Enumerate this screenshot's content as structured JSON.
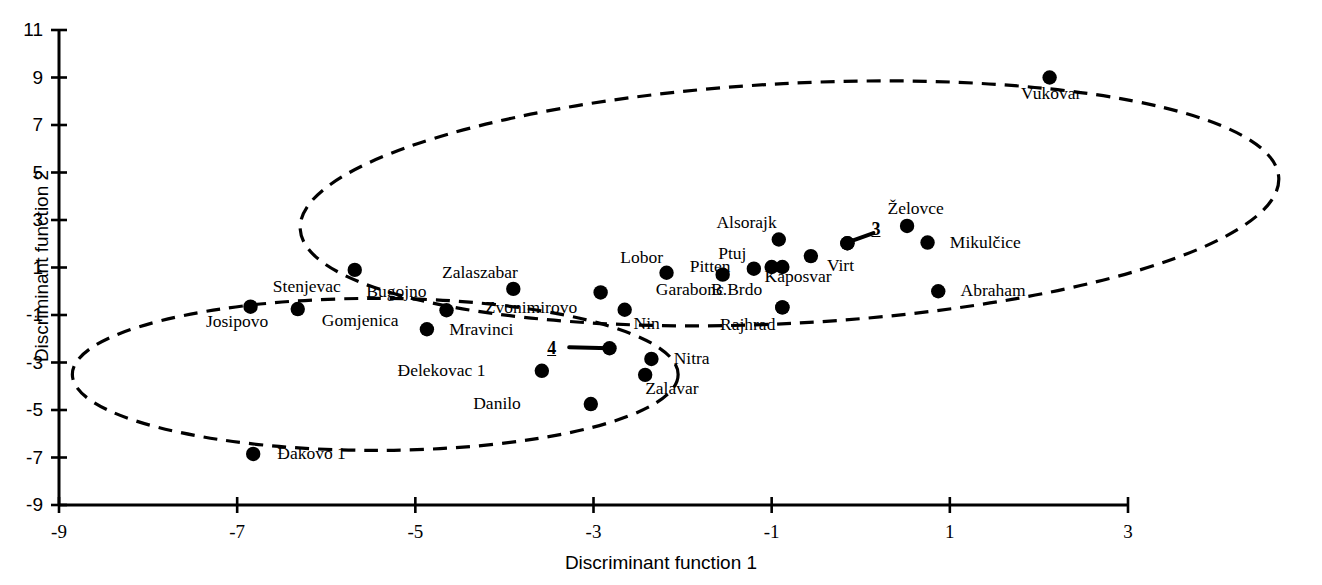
{
  "chart_data": {
    "type": "scatter",
    "title": "",
    "xlabel": "Discriminant function 1",
    "ylabel": "Discriminant function 2",
    "xlim": [
      -9,
      3
    ],
    "ylim": [
      -9,
      11
    ],
    "xticks": [
      -9,
      -7,
      -5,
      -3,
      -1,
      1,
      3
    ],
    "xtick_labels": [
      "-9",
      "-7",
      "-5",
      "-3",
      "-1",
      "1",
      "3"
    ],
    "yticks": [
      -9,
      -7,
      -5,
      -3,
      -1,
      1,
      3,
      5,
      7,
      9,
      11
    ],
    "ytick_labels": [
      "-9",
      "-7",
      "-5",
      "-3",
      "-1",
      "1",
      "3",
      "5",
      "7",
      "9",
      "11"
    ],
    "grid": false,
    "legend": "none",
    "marker_color": "#000000",
    "points": [
      {
        "label": "Josipovo",
        "x": -6.85,
        "y": -0.65,
        "lx": -7.35,
        "ly": -1.3,
        "anchor": "start"
      },
      {
        "label": "Stenjevac",
        "x": -5.68,
        "y": 0.9,
        "lx": -6.6,
        "ly": 0.2,
        "anchor": "start"
      },
      {
        "label": "Gomjenica",
        "x": -6.32,
        "y": -0.75,
        "lx": -6.05,
        "ly": -1.25,
        "anchor": "start"
      },
      {
        "label": "Bugojno",
        "x": -4.65,
        "y": -0.8,
        "lx": -5.55,
        "ly": -0.05,
        "anchor": "start"
      },
      {
        "label": "Mravinci",
        "x": -4.87,
        "y": -1.6,
        "lx": -4.62,
        "ly": -1.62,
        "anchor": "start"
      },
      {
        "label": "Zalaszabar",
        "x": -3.9,
        "y": 0.1,
        "lx": -4.7,
        "ly": 0.78,
        "anchor": "start"
      },
      {
        "label": "Zvonimirovo",
        "x": -2.92,
        "y": -0.05,
        "lx": -4.22,
        "ly": -0.72,
        "anchor": "start"
      },
      {
        "label": "Nin",
        "x": -2.65,
        "y": -0.78,
        "lx": -2.55,
        "ly": -1.38,
        "anchor": "start"
      },
      {
        "label": "4",
        "x": -2.82,
        "y": -2.4,
        "lx": -3.52,
        "ly": -2.4,
        "anchor": "start",
        "leader": true,
        "numeric": true
      },
      {
        "label": "Nitra",
        "x": -2.35,
        "y": -2.85,
        "lx": -2.1,
        "ly": -2.85,
        "anchor": "start"
      },
      {
        "label": "Zalavar",
        "x": -2.42,
        "y": -3.52,
        "lx": -2.42,
        "ly": -4.12,
        "anchor": "start"
      },
      {
        "label": "Đelekovac 1",
        "x": -3.58,
        "y": -3.35,
        "lx": -5.2,
        "ly": -3.35,
        "anchor": "start"
      },
      {
        "label": "Danilo",
        "x": -3.03,
        "y": -4.75,
        "lx": -4.35,
        "ly": -4.75,
        "anchor": "start"
      },
      {
        "label": "Đakovo 1",
        "x": -6.82,
        "y": -6.85,
        "lx": -6.55,
        "ly": -6.85,
        "anchor": "start"
      },
      {
        "label": "Lobor",
        "x": -2.18,
        "y": 0.78,
        "lx": -2.7,
        "ly": 1.38,
        "anchor": "start"
      },
      {
        "label": "Garabonc",
        "x": -1.55,
        "y": 0.7,
        "lx": -2.3,
        "ly": 0.05,
        "anchor": "start"
      },
      {
        "label": "Pitten",
        "x": -1.0,
        "y": 1.02,
        "lx": -1.92,
        "ly": 1.02,
        "anchor": "start"
      },
      {
        "label": "Ptuj",
        "x": -1.2,
        "y": 0.95,
        "lx": -1.6,
        "ly": 1.55,
        "anchor": "start"
      },
      {
        "label": "",
        "x": -0.88,
        "y": 1.02,
        "lx": 0,
        "ly": 0,
        "anchor": "start"
      },
      {
        "label": "Alsorajk",
        "x": -0.92,
        "y": 2.18,
        "lx": -1.62,
        "ly": 2.88,
        "anchor": "start"
      },
      {
        "label": "Kaposvar",
        "x": -0.56,
        "y": 1.48,
        "lx": -1.08,
        "ly": 0.6,
        "anchor": "start"
      },
      {
        "label": "Virt",
        "x": -0.15,
        "y": 2.02,
        "lx": -0.38,
        "ly": 1.08,
        "anchor": "start"
      },
      {
        "label": "3",
        "x": -0.15,
        "y": 2.02,
        "lx": 0.12,
        "ly": 2.62,
        "anchor": "start",
        "numeric": true
      },
      {
        "label": "B.Brdo",
        "x": -0.88,
        "y": -0.68,
        "lx": -1.68,
        "ly": 0.05,
        "anchor": "start"
      },
      {
        "label": "Rajhrad",
        "x": -0.88,
        "y": -0.68,
        "lx": -1.58,
        "ly": -1.42,
        "anchor": "start"
      },
      {
        "label": "Želovce",
        "x": 0.52,
        "y": 2.75,
        "lx": 0.3,
        "ly": 3.45,
        "anchor": "start"
      },
      {
        "label": "Mikulčice",
        "x": 0.75,
        "y": 2.05,
        "lx": 1.0,
        "ly": 2.05,
        "anchor": "start"
      },
      {
        "label": "Abraham",
        "x": 0.87,
        "y": 0.0,
        "lx": 1.12,
        "ly": 0.0,
        "anchor": "start"
      },
      {
        "label": "Vukovar",
        "x": 2.12,
        "y": 9.0,
        "lx": 1.8,
        "ly": 8.3,
        "anchor": "start"
      }
    ],
    "clusters": [
      {
        "name": "left-cluster-ellipse",
        "cx": -5.45,
        "cy": -3.5,
        "rx": 3.4,
        "ry": 3.2,
        "rotation": 0,
        "style": "dashed"
      },
      {
        "name": "right-cluster-ellipse",
        "cx": -0.8,
        "cy": 3.7,
        "rx": 5.5,
        "ry": 5.05,
        "rotation": -3,
        "style": "dashed"
      }
    ]
  }
}
